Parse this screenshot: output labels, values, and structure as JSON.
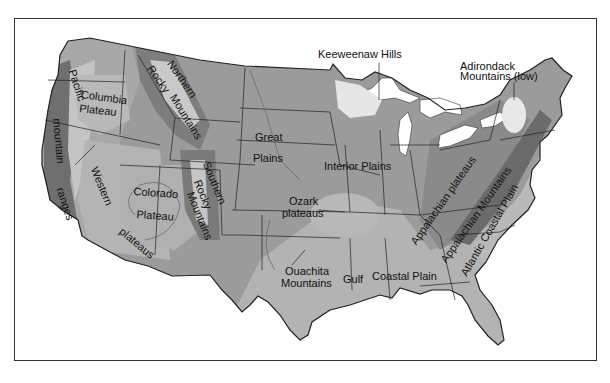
{
  "map": {
    "title": "Physiographic regions of the contiguous United States",
    "colors": {
      "frame": "#333333",
      "background": "#ffffff",
      "land_base": "#9a9a9a",
      "land_dark": "#7f7f7f",
      "land_light": "#b8b8b8",
      "highland_light": "#e8e8e8",
      "water": "#ffffff",
      "border_line": "#222222"
    },
    "labels": {
      "pacific": "Pacific",
      "mountain": "mountain",
      "ranges": "ranges",
      "columbia_1": "Columbia",
      "columbia_2": "Plateau",
      "northern_rocky_1": "Northern",
      "northern_rocky_2": "Rocky",
      "northern_rocky_3": "Mountains",
      "great_plains_1": "Great",
      "great_plains_2": "Plains",
      "keweenaw": "Keeweenaw Hills",
      "adirondack_1": "Adirondack",
      "adirondack_2": "Mountains (low)",
      "interior_plains": "Interior Plains",
      "western": "Western",
      "western_plateaus": "plateaus",
      "colorado_1": "Colorado",
      "colorado_2": "Plateau",
      "southern_rocky_1": "Southern",
      "southern_rocky_2": "Rocky",
      "southern_rocky_3": "Mountains",
      "ozark_1": "Ozark",
      "ozark_2": "plateaus",
      "ouachita_1": "Ouachita",
      "ouachita_2": "Mountains",
      "gulf": "Gulf",
      "gulf_coastal_plain": "Coastal Plain",
      "appalachian_plateaus": "Appalachian plateaus",
      "appalachian_mountains": "Appalachian Mountains",
      "atlantic_coastal_plain": "Atlantic Coastal Plain"
    }
  }
}
